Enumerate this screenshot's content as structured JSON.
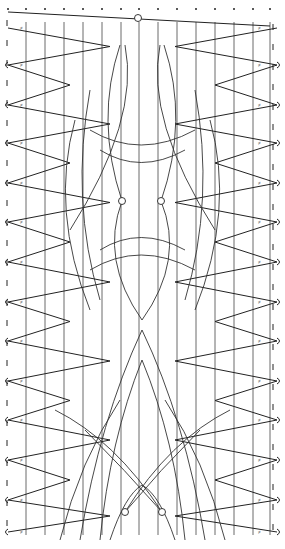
{
  "diagram": {
    "type": "bobbin-lace-pricking",
    "width": 285,
    "height": 549,
    "colors": {
      "background": "#ffffff",
      "line": "#222222"
    },
    "vertical_lines_x": [
      26,
      45,
      64,
      83,
      102,
      121,
      139,
      158,
      177,
      196,
      215,
      234,
      253,
      270
    ],
    "top_dots_x": [
      8,
      26,
      45,
      64,
      83,
      102,
      121,
      139,
      158,
      177,
      196,
      215,
      234,
      253,
      270
    ],
    "pinholes": [
      {
        "x": 138,
        "y": 18,
        "label": "top-pin"
      },
      {
        "x": 122,
        "y": 201,
        "label": "mid-left-pin"
      },
      {
        "x": 161,
        "y": 201,
        "label": "mid-right-pin"
      },
      {
        "x": 125,
        "y": 512,
        "label": "bottom-left-pin"
      },
      {
        "x": 162,
        "y": 512,
        "label": "bottom-right-pin"
      }
    ],
    "zigzag_rows_y": [
      28,
      65,
      105,
      143,
      183,
      222,
      262,
      302,
      341,
      381,
      420,
      460,
      500,
      532
    ]
  }
}
